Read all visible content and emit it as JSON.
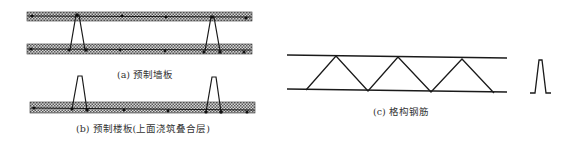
{
  "figure": {
    "panels": [
      {
        "id": "a",
        "caption": "(a) 预制墙板"
      },
      {
        "id": "b",
        "caption": "(b) 预制楼板(上面浇筑叠合层)"
      },
      {
        "id": "c",
        "caption": "(c) 格构钢筋"
      }
    ],
    "colors": {
      "line": "#1a1a1a",
      "hatch_dark": "#555555",
      "hatch_light": "#d8d8d8"
    }
  }
}
